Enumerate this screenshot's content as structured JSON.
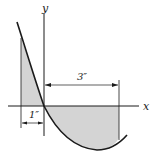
{
  "figure": {
    "axes": {
      "x_label": "x",
      "y_label": "y"
    },
    "dimensions": [
      {
        "label": "3″",
        "description": "distance from y-axis to right boundary"
      },
      {
        "label": "1″",
        "description": "distance from left boundary to y-axis"
      }
    ],
    "colors": {
      "line": "#1a1a1a",
      "shade": "#d4d4d4",
      "background": "#ffffff"
    }
  }
}
